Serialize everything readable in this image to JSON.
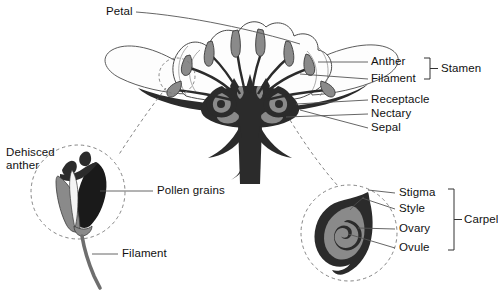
{
  "figure": {
    "background_color": "#ffffff",
    "text_color": "#111111",
    "colors": {
      "dark": "#2b2b2b",
      "mid_grey": "#8a8a8a",
      "light_grey": "#bdbdbd",
      "outline": "#4a4a4a",
      "leader_line": "#555555",
      "dashed": "#777777",
      "petal_fill": "#fdfdfd"
    }
  },
  "labels": {
    "petal": "Petal",
    "anther": "Anther",
    "filament": "Filament",
    "stamen": "Stamen",
    "receptacle": "Receptacle",
    "nectary": "Nectary",
    "sepal": "Sepal",
    "dehisced_anther_line1": "Dehisced",
    "dehisced_anther_line2": "anther",
    "pollen_grains": "Pollen grains",
    "inset_filament": "Filament",
    "stigma": "Stigma",
    "style": "Style",
    "ovary": "Ovary",
    "ovule": "Ovule",
    "carpel": "Carpel"
  },
  "brackets": [
    {
      "name": "stamen",
      "label": "Stamen",
      "groups": [
        "Anther",
        "Filament"
      ]
    },
    {
      "name": "carpel",
      "label": "Carpel",
      "groups": [
        "Stigma",
        "Style",
        "Ovary",
        "Ovule"
      ]
    }
  ],
  "insets": [
    {
      "name": "dehisced-anther-inset",
      "title": "Dehisced anther",
      "parts": [
        "Pollen grains",
        "Filament"
      ]
    },
    {
      "name": "carpel-inset",
      "title": "Carpel",
      "parts": [
        "Stigma",
        "Style",
        "Ovary",
        "Ovule"
      ]
    }
  ],
  "main_flower": {
    "name": "flower-cross-section",
    "parts": [
      "Petal",
      "Anther",
      "Filament",
      "Receptacle",
      "Nectary",
      "Sepal"
    ]
  }
}
